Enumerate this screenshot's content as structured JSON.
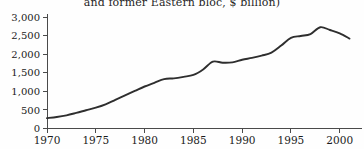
{
  "chart_data": {
    "type": "line",
    "title": "and former Eastern bloc, $ billion)",
    "xlabel": "",
    "ylabel": "",
    "xlim": [
      1970,
      2001
    ],
    "ylim": [
      0,
      3000
    ],
    "grid": false,
    "legend": null,
    "x_ticks": [
      "1970",
      "1975",
      "1980",
      "1985",
      "1990",
      "1995",
      "2000"
    ],
    "x_tick_values": [
      1970,
      1975,
      1980,
      1985,
      1990,
      1995,
      2000
    ],
    "y_ticks": [
      "0",
      "500",
      "1,000",
      "1,500",
      "2,000",
      "2,500",
      "3,000"
    ],
    "y_tick_values": [
      0,
      500,
      1000,
      1500,
      2000,
      2500,
      3000
    ],
    "line_color": "#2e2e2e",
    "background_color": "#fefefe",
    "axis_color": "#4a4a4a",
    "x": [
      1970,
      1971,
      1972,
      1973,
      1974,
      1975,
      1976,
      1977,
      1978,
      1979,
      1980,
      1981,
      1982,
      1983,
      1984,
      1985,
      1986,
      1987,
      1988,
      1989,
      1990,
      1991,
      1992,
      1993,
      1994,
      1995,
      1996,
      1997,
      1998,
      1999,
      2000,
      2001
    ],
    "values": [
      280,
      310,
      355,
      420,
      490,
      560,
      650,
      770,
      890,
      1010,
      1130,
      1230,
      1330,
      1350,
      1390,
      1440,
      1590,
      1800,
      1770,
      1780,
      1850,
      1900,
      1960,
      2040,
      2230,
      2440,
      2490,
      2540,
      2725,
      2650,
      2560,
      2420
    ]
  }
}
